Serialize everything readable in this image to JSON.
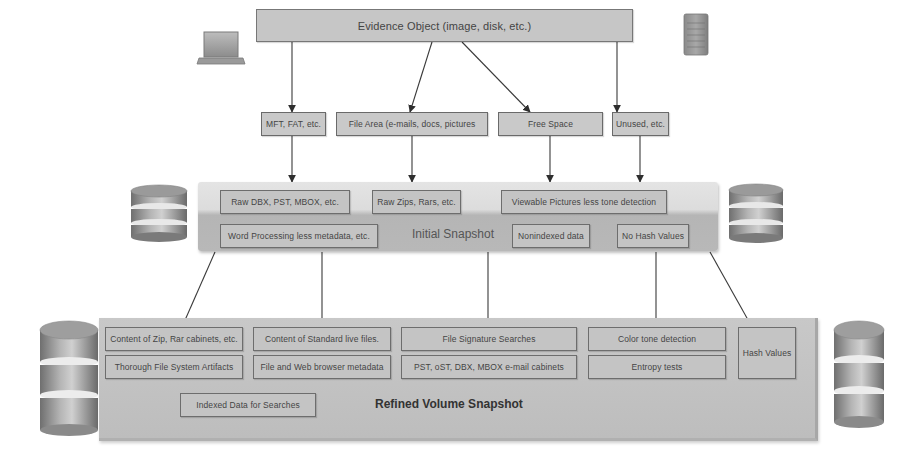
{
  "evidence": {
    "label": "Evidence Object (image, disk, etc.)"
  },
  "sources": [
    {
      "label": "MFT, FAT, etc."
    },
    {
      "label": "File Area (e-mails, docs, pictures"
    },
    {
      "label": "Free Space"
    },
    {
      "label": "Unused, etc."
    }
  ],
  "initial_snapshot": {
    "title": "Initial Snapshot",
    "items": [
      {
        "label": "Raw DBX, PST, MBOX, etc."
      },
      {
        "label": "Raw Zips, Rars, etc."
      },
      {
        "label": "Viewable Pictures less tone detection"
      },
      {
        "label": "Word Processing less metadata, etc."
      },
      {
        "label": "Nonindexed data"
      },
      {
        "label": "No Hash Values"
      }
    ]
  },
  "refined_snapshot": {
    "title": "Refined Volume Snapshot",
    "items": [
      {
        "label": "Content of Zip, Rar cabinets, etc."
      },
      {
        "label": "Thorough File System Artifacts"
      },
      {
        "label": "Content of Standard live files."
      },
      {
        "label": "File and Web browser metadata"
      },
      {
        "label": "File Signature Searches"
      },
      {
        "label": "PST, oST, DBX, MBOX e-mail cabinets"
      },
      {
        "label": "Color tone detection"
      },
      {
        "label": "Entropy tests"
      },
      {
        "label": "Hash Values"
      },
      {
        "label": "Indexed Data for Searches"
      }
    ]
  },
  "icons": {
    "top_left": "laptop-icon",
    "top_right": "server-tower-icon",
    "middle_left": "database-icon",
    "middle_right": "database-icon",
    "bottom_left": "database-icon",
    "bottom_right": "database-icon"
  },
  "colors": {
    "box_fill": "#c9c9c9",
    "box_border": "#6a6a6a",
    "arrow": "#333333",
    "text": "#444444"
  }
}
